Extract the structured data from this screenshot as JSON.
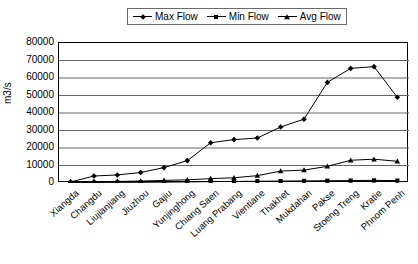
{
  "chart_data": {
    "type": "line",
    "title": "",
    "xlabel": "",
    "ylabel": "m3/s",
    "ylim": [
      0,
      80000
    ],
    "ytick_values": [
      80000,
      70000,
      60000,
      50000,
      40000,
      30000,
      20000,
      10000,
      0
    ],
    "ytick_labels": [
      "80000",
      "70000",
      "60000",
      "50000",
      "40000",
      "30000",
      "20000",
      "10000",
      "0"
    ],
    "grid": "horizontal",
    "legend_position": "top-center",
    "categories": [
      "Xiangda",
      "Changdu",
      "Liujianjiang",
      "Jiuzhou",
      "Gajiu",
      "Yunjinghong",
      "Chiang Saen",
      "Luang Prabang",
      "Vientiane",
      "Thakhet",
      "Mukdahan",
      "Pakse",
      "Stoeng Treng",
      "Kratie",
      "Phnom Penh"
    ],
    "series": [
      {
        "name": "Max Flow",
        "marker": "diamond",
        "color": "#000000",
        "values": [
          600,
          4000,
          4600,
          6000,
          8800,
          12800,
          23000,
          24800,
          25700,
          32000,
          36500,
          57500,
          65500,
          66500,
          49000
        ]
      },
      {
        "name": "Min Flow",
        "marker": "square",
        "color": "#000000",
        "values": [
          150,
          300,
          350,
          400,
          500,
          600,
          800,
          900,
          1000,
          1100,
          1200,
          1300,
          1400,
          1500,
          1400
        ]
      },
      {
        "name": "Avg Flow",
        "marker": "triangle",
        "color": "#000000",
        "values": [
          300,
          700,
          900,
          1100,
          1500,
          1800,
          2500,
          3000,
          4200,
          6800,
          7400,
          9500,
          13000,
          13600,
          12400
        ]
      }
    ]
  },
  "legend": {
    "entries": [
      {
        "label": "Max Flow",
        "marker": "diamond"
      },
      {
        "label": "Min Flow",
        "marker": "square"
      },
      {
        "label": "Avg Flow",
        "marker": "triangle"
      }
    ]
  }
}
